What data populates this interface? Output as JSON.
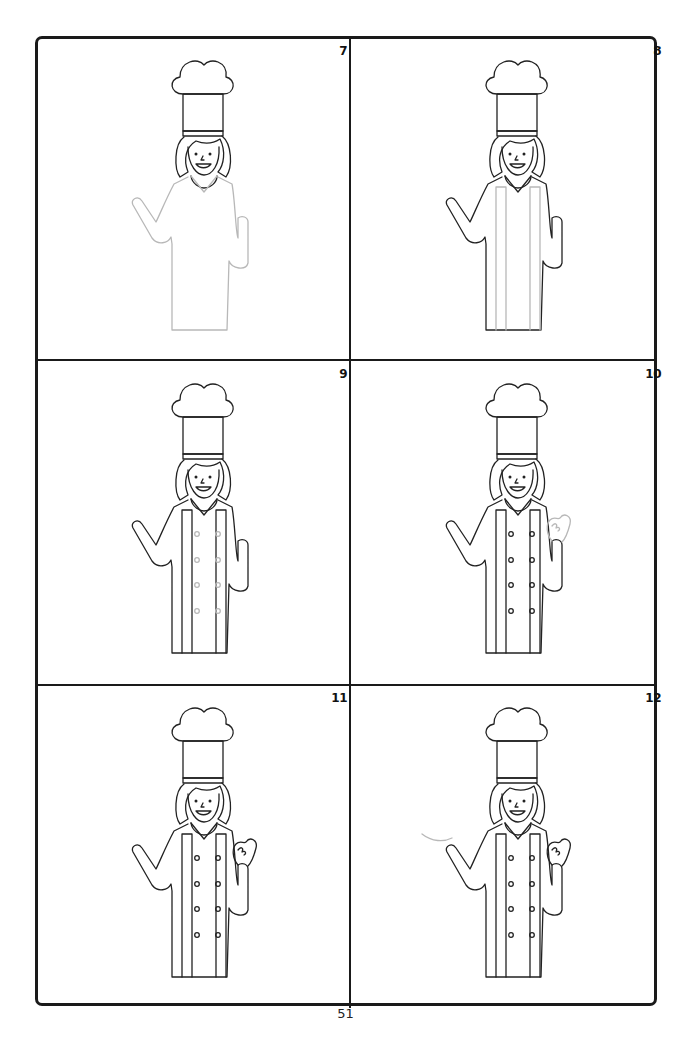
{
  "document": {
    "type": "step-by-step drawing tutorial",
    "subject": "female chef",
    "page_number": "51"
  },
  "colors": {
    "ink": "#222222",
    "new_step_lines": "#b8b8b8",
    "frame": "#1a1a1a",
    "background": "#ffffff"
  },
  "panels": [
    {
      "step": "7",
      "new_element": "body-and-arms-outline",
      "buttons_drawn": false,
      "placket": false,
      "hand": "raised-arm"
    },
    {
      "step": "8",
      "new_element": "jacket-placket",
      "buttons_drawn": false,
      "placket": true,
      "hand": "raised-arm"
    },
    {
      "step": "9",
      "new_element": "buttons",
      "buttons_drawn": true,
      "placket": true,
      "hand": "raised-arm"
    },
    {
      "step": "10",
      "new_element": "waving-hand",
      "buttons_drawn": true,
      "placket": true,
      "hand": "hand-new"
    },
    {
      "step": "11",
      "new_element": "none",
      "buttons_drawn": true,
      "placket": true,
      "hand": "hand-done"
    },
    {
      "step": "12",
      "new_element": "motion-line",
      "buttons_drawn": true,
      "placket": true,
      "hand": "hand-done"
    }
  ]
}
